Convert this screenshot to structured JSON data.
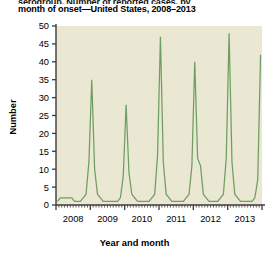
{
  "figure": {
    "title_line1": "serogroup. Number of reported cases, by",
    "title_line2": "month of onset—United States, 2008–2013",
    "ylabel": "Number",
    "xlabel": "Year and month"
  },
  "colors": {
    "line": "#6f9e62",
    "plot_background": "#eae7d2",
    "axis": "#3b3b3b",
    "page_background": "#ffffff",
    "text": "#000000"
  },
  "chart_data": {
    "type": "line",
    "title": "serogroup. Number of reported cases, by month of onset—United States, 2008–2013",
    "xlabel": "Year and month",
    "ylabel": "Number",
    "ylim": [
      0,
      50
    ],
    "ytick_labels": [
      "0",
      "5",
      "10",
      "15",
      "20",
      "25",
      "30",
      "35",
      "40",
      "45",
      "50"
    ],
    "ytick_values": [
      0,
      5,
      10,
      15,
      20,
      25,
      30,
      35,
      40,
      45,
      50
    ],
    "xtick_labels": [
      "2008",
      "2009",
      "2010",
      "2011",
      "2012",
      "2013"
    ],
    "xlim_months": [
      0,
      72
    ],
    "grid": false,
    "legend": null,
    "minor_ticks": "monthly",
    "x": [
      "2008-01",
      "2008-02",
      "2008-03",
      "2008-04",
      "2008-05",
      "2008-06",
      "2008-07",
      "2008-08",
      "2008-09",
      "2008-10",
      "2008-11",
      "2008-12",
      "2009-01",
      "2009-02",
      "2009-03",
      "2009-04",
      "2009-05",
      "2009-06",
      "2009-07",
      "2009-08",
      "2009-09",
      "2009-10",
      "2009-11",
      "2009-12",
      "2010-01",
      "2010-02",
      "2010-03",
      "2010-04",
      "2010-05",
      "2010-06",
      "2010-07",
      "2010-08",
      "2010-09",
      "2010-10",
      "2010-11",
      "2010-12",
      "2011-01",
      "2011-02",
      "2011-03",
      "2011-04",
      "2011-05",
      "2011-06",
      "2011-07",
      "2011-08",
      "2011-09",
      "2011-10",
      "2011-11",
      "2011-12",
      "2012-01",
      "2012-02",
      "2012-03",
      "2012-04",
      "2012-05",
      "2012-06",
      "2012-07",
      "2012-08",
      "2012-09",
      "2012-10",
      "2012-11",
      "2012-12",
      "2013-01",
      "2013-02",
      "2013-03",
      "2013-04",
      "2013-05",
      "2013-06",
      "2013-07",
      "2013-08",
      "2013-09",
      "2013-10",
      "2013-11",
      "2013-12"
    ],
    "values": [
      1,
      2,
      2,
      2,
      2,
      2,
      1,
      1,
      1,
      2,
      3,
      12,
      35,
      10,
      3,
      2,
      1,
      1,
      1,
      1,
      1,
      1,
      2,
      8,
      28,
      9,
      3,
      2,
      1,
      1,
      1,
      1,
      1,
      2,
      3,
      14,
      47,
      12,
      3,
      2,
      1,
      1,
      1,
      1,
      1,
      2,
      3,
      11,
      40,
      13,
      11,
      3,
      2,
      1,
      1,
      1,
      1,
      2,
      3,
      13,
      48,
      12,
      3,
      2,
      1,
      1,
      1,
      1,
      1,
      2,
      7,
      42
    ],
    "peaks": [
      {
        "label": "2009 peak",
        "month": "2009-01",
        "value": 35
      },
      {
        "label": "2010 peak",
        "month": "2010-01",
        "value": 28
      },
      {
        "label": "2011 peak",
        "month": "2011-01",
        "value": 47
      },
      {
        "label": "2012 peak",
        "month": "2012-01",
        "value": 40
      },
      {
        "label": "2013 peak",
        "month": "2013-01",
        "value": 48
      },
      {
        "label": "2013 year-end peak",
        "month": "2013-12",
        "value": 42
      }
    ]
  }
}
